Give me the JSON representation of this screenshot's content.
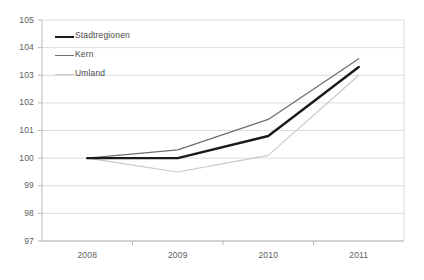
{
  "chart_data": {
    "type": "line",
    "title": "",
    "xlabel": "",
    "ylabel": "",
    "categories": [
      "2008",
      "2009",
      "2010",
      "2011"
    ],
    "ylim": [
      97,
      105
    ],
    "yticks": [
      "97",
      "98",
      "99",
      "100",
      "101",
      "102",
      "103",
      "104",
      "105"
    ],
    "grid": true,
    "legend_position": "inside-top-left",
    "series": [
      {
        "name": "Stadtregionen",
        "values": [
          100.0,
          100.0,
          100.8,
          103.3
        ],
        "color": "#1a1a1a",
        "width": 2.4
      },
      {
        "name": "Kern",
        "values": [
          100.0,
          100.3,
          101.4,
          103.6
        ],
        "color": "#6e6e6e",
        "width": 1.3
      },
      {
        "name": "Umland",
        "values": [
          100.0,
          99.5,
          100.1,
          103.0
        ],
        "color": "#c8c8c8",
        "width": 1.1
      }
    ]
  },
  "axis": {
    "frame_color": "#b7b7b7",
    "grid_color": "#dcdcdc",
    "tick_color": "#b7b7b7"
  }
}
